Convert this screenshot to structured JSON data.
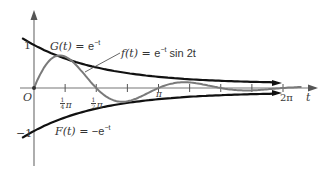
{
  "figure": {
    "type": "function-plot",
    "axes": {
      "x_label": "t",
      "y_ticks": [
        {
          "value": 1,
          "label": "1"
        },
        {
          "value": -1,
          "label": "−1"
        }
      ],
      "origin_label": "O",
      "x_ticks": [
        {
          "value": "π/4",
          "label_num": "1",
          "label_den": "4",
          "label_sym": "π"
        },
        {
          "value": "π/2",
          "label_num": "1",
          "label_den": "2",
          "label_sym": "π"
        },
        {
          "value": "3π/4",
          "label": ""
        },
        {
          "value": "π",
          "label": "π"
        },
        {
          "value": "5π/4",
          "label": ""
        },
        {
          "value": "3π/2",
          "label": ""
        },
        {
          "value": "7π/4",
          "label": ""
        },
        {
          "value": "2π",
          "label": "2π"
        }
      ]
    },
    "curves": [
      {
        "id": "G",
        "name": "G(t)",
        "expr": "e",
        "exp": "−t",
        "lhs": "G(t) = ",
        "color": "#111111"
      },
      {
        "id": "f",
        "name": "f(t)",
        "expr": "e",
        "exp": "−t",
        "tail": " sin 2t",
        "lhs": "f(t) = ",
        "color": "#777777"
      },
      {
        "id": "F",
        "name": "F(t)",
        "expr": "−e",
        "exp": "−t",
        "lhs": "F(t) = ",
        "color": "#111111"
      }
    ],
    "colors": {
      "axis": "#555555",
      "envelope": "#111111",
      "oscillation": "#7a7a7a",
      "text": "#333333"
    }
  }
}
